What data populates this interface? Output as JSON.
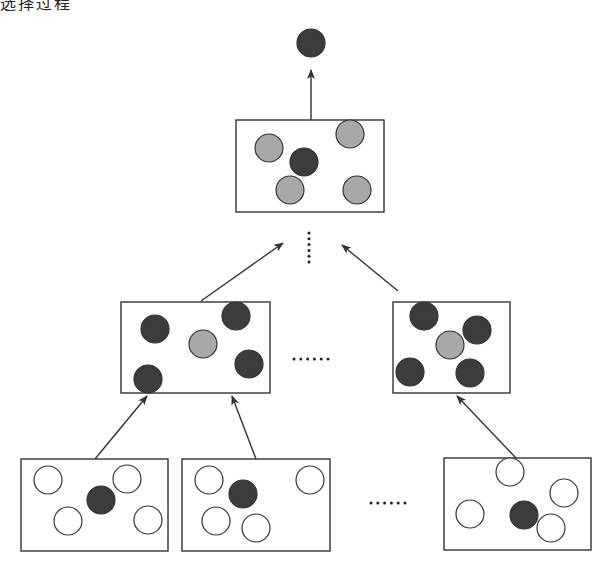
{
  "caption": "选择过程",
  "colors": {
    "dark": "#3c3c3c",
    "gray": "#a8a8a8",
    "white": "#ffffff",
    "stroke": "#333333"
  },
  "diagram": {
    "type": "hierarchical-selection-tree",
    "top_node": {
      "cx": 311,
      "cy": 43,
      "fill": "dark"
    },
    "levels": [
      {
        "name": "top",
        "boxes": [
          {
            "x": 236,
            "y": 120,
            "w": 148,
            "h": 92,
            "circles": [
              {
                "cx": 269,
                "cy": 148,
                "fill": "gray"
              },
              {
                "cx": 350,
                "cy": 134,
                "fill": "gray"
              },
              {
                "cx": 304,
                "cy": 162,
                "fill": "dark"
              },
              {
                "cx": 290,
                "cy": 190,
                "fill": "gray"
              },
              {
                "cx": 357,
                "cy": 190,
                "fill": "gray"
              }
            ]
          }
        ]
      },
      {
        "name": "middle",
        "boxes": [
          {
            "x": 121,
            "y": 302,
            "w": 149,
            "h": 91,
            "circles": [
              {
                "cx": 155,
                "cy": 329,
                "fill": "dark"
              },
              {
                "cx": 236,
                "cy": 316,
                "fill": "dark"
              },
              {
                "cx": 203,
                "cy": 344,
                "fill": "gray"
              },
              {
                "cx": 249,
                "cy": 364,
                "fill": "dark"
              },
              {
                "cx": 148,
                "cy": 379,
                "fill": "dark"
              }
            ]
          },
          {
            "x": 393,
            "y": 302,
            "w": 117,
            "h": 91,
            "circles": [
              {
                "cx": 424,
                "cy": 316,
                "fill": "dark"
              },
              {
                "cx": 450,
                "cy": 345,
                "fill": "gray"
              },
              {
                "cx": 477,
                "cy": 330,
                "fill": "dark"
              },
              {
                "cx": 410,
                "cy": 372,
                "fill": "dark"
              },
              {
                "cx": 470,
                "cy": 373,
                "fill": "dark"
              }
            ]
          }
        ]
      },
      {
        "name": "bottom",
        "boxes": [
          {
            "x": 21,
            "y": 459,
            "w": 147,
            "h": 92,
            "circles": [
              {
                "cx": 48,
                "cy": 480,
                "fill": "white"
              },
              {
                "cx": 127,
                "cy": 479,
                "fill": "white"
              },
              {
                "cx": 101,
                "cy": 500,
                "fill": "dark"
              },
              {
                "cx": 68,
                "cy": 521,
                "fill": "white"
              },
              {
                "cx": 148,
                "cy": 520,
                "fill": "white"
              }
            ]
          },
          {
            "x": 182,
            "y": 459,
            "w": 148,
            "h": 92,
            "circles": [
              {
                "cx": 209,
                "cy": 480,
                "fill": "white"
              },
              {
                "cx": 243,
                "cy": 494,
                "fill": "dark"
              },
              {
                "cx": 310,
                "cy": 480,
                "fill": "white"
              },
              {
                "cx": 216,
                "cy": 521,
                "fill": "white"
              },
              {
                "cx": 256,
                "cy": 528,
                "fill": "white"
              }
            ]
          },
          {
            "x": 444,
            "y": 458,
            "w": 147,
            "h": 92,
            "circles": [
              {
                "cx": 510,
                "cy": 472,
                "fill": "white"
              },
              {
                "cx": 564,
                "cy": 493,
                "fill": "white"
              },
              {
                "cx": 524,
                "cy": 515,
                "fill": "dark"
              },
              {
                "cx": 470,
                "cy": 514,
                "fill": "white"
              },
              {
                "cx": 551,
                "cy": 528,
                "fill": "white"
              }
            ]
          }
        ]
      }
    ],
    "arrows": [
      {
        "from": [
          311,
          120
        ],
        "to": [
          311,
          70
        ]
      },
      {
        "from": [
          201,
          301
        ],
        "to": [
          283,
          243
        ]
      },
      {
        "from": [
          398,
          291
        ],
        "to": [
          342,
          245
        ]
      },
      {
        "from": [
          95,
          459
        ],
        "to": [
          147,
          396
        ]
      },
      {
        "from": [
          256,
          459
        ],
        "to": [
          232,
          396
        ]
      },
      {
        "from": [
          516,
          458
        ],
        "to": [
          457,
          396
        ]
      }
    ],
    "ellipses": [
      {
        "orientation": "vertical",
        "x": 309,
        "y1": 233,
        "y2": 262,
        "count": 6
      },
      {
        "orientation": "horizontal",
        "y": 359,
        "x1": 294,
        "x2": 328,
        "count": 6
      },
      {
        "orientation": "horizontal",
        "y": 503,
        "x1": 371,
        "x2": 405,
        "count": 6
      }
    ],
    "circle_radius": 14
  }
}
